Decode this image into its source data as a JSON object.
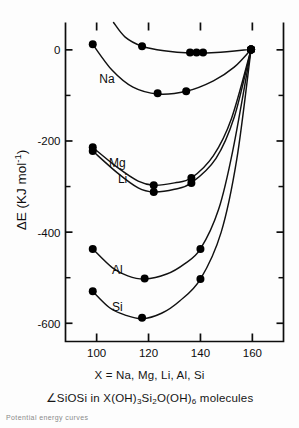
{
  "figure": {
    "xaxis_caption_prefix": "X = ",
    "xaxis_caption_values": "Na, Mg, Li, Al, Si",
    "caption_angle_symbol": "∠",
    "caption_text_a": "SiOSi in X(OH)",
    "caption_sub_3": "3",
    "caption_text_b": "Si",
    "caption_sub_2": "2",
    "caption_text_c": "O(OH)",
    "caption_sub_6": "6",
    "caption_text_d": " molecules",
    "fragment_text": "Potential energy curves",
    "axis_color": "#0d0d0d",
    "curve_color": "#111111",
    "marker_color": "#000000"
  },
  "chart_data": {
    "type": "line",
    "title": "",
    "subtitle": "∠SiOSi in X(OH)3Si2O(OH)6 molecules",
    "xlabel": "X = Na, Mg, Li, Al, Si",
    "ylabel": "ΔE ( KJ mol⁻¹ )",
    "ylabel_parts": {
      "delta": "ΔE (",
      "unit": "KJ mol",
      "exponent": "-1",
      "close": ")"
    },
    "xlim": [
      88,
      172
    ],
    "ylim": [
      -640,
      60
    ],
    "xticks": [
      100,
      120,
      140,
      160
    ],
    "xticklabels": [
      "100",
      "120",
      "140",
      "160"
    ],
    "xminorticks": [
      110,
      130,
      150,
      170
    ],
    "yticks": [
      0,
      -200,
      -400,
      -600
    ],
    "yticklabels": [
      "0",
      "-200",
      "-400",
      "-600"
    ],
    "yminorticks": [
      -100,
      -300,
      -500
    ],
    "grid": false,
    "legend": "inline-labels",
    "series": [
      {
        "name": "H2O (upper)",
        "label": "",
        "label_x": null,
        "label_y": null,
        "points": [
          {
            "x": 98.5,
            "y": 12
          },
          {
            "x": 117.5,
            "y": 8
          },
          {
            "x": 136.0,
            "y": -6
          },
          {
            "x": 138.5,
            "y": -6
          },
          {
            "x": 141.0,
            "y": -6
          },
          {
            "x": 159.5,
            "y": 1
          }
        ],
        "curve": [
          {
            "x": 106.5,
            "y": 60
          },
          {
            "x": 111.0,
            "y": 28
          },
          {
            "x": 117.5,
            "y": 8
          },
          {
            "x": 126.0,
            "y": -2
          },
          {
            "x": 136.0,
            "y": -7
          },
          {
            "x": 146.0,
            "y": -6
          },
          {
            "x": 159.5,
            "y": 1
          }
        ]
      },
      {
        "name": "Na",
        "label": "Na",
        "label_x": 104,
        "label_y": -73,
        "points": [
          {
            "x": 123.5,
            "y": -95
          },
          {
            "x": 134.5,
            "y": -91
          },
          {
            "x": 159.5,
            "y": 1
          }
        ],
        "curve": [
          {
            "x": 98.5,
            "y": 12
          },
          {
            "x": 106.0,
            "y": -45
          },
          {
            "x": 114.0,
            "y": -82
          },
          {
            "x": 123.5,
            "y": -97
          },
          {
            "x": 134.5,
            "y": -91
          },
          {
            "x": 145.0,
            "y": -68
          },
          {
            "x": 153.0,
            "y": -38
          },
          {
            "x": 159.5,
            "y": 1
          }
        ]
      },
      {
        "name": "Mg",
        "label": "Mg",
        "label_x": 108,
        "label_y": -258,
        "points": [
          {
            "x": 98.5,
            "y": -214
          },
          {
            "x": 122.0,
            "y": -297
          },
          {
            "x": 136.5,
            "y": -281
          },
          {
            "x": 159.5,
            "y": 1
          }
        ],
        "curve": [
          {
            "x": 98.5,
            "y": -214
          },
          {
            "x": 108.0,
            "y": -258
          },
          {
            "x": 116.0,
            "y": -288
          },
          {
            "x": 122.0,
            "y": -297
          },
          {
            "x": 130.0,
            "y": -292
          },
          {
            "x": 136.5,
            "y": -281
          },
          {
            "x": 145.0,
            "y": -232
          },
          {
            "x": 152.0,
            "y": -150
          },
          {
            "x": 159.5,
            "y": 1
          }
        ]
      },
      {
        "name": "Li",
        "label": "Li",
        "label_x": 110,
        "label_y": -292,
        "points": [
          {
            "x": 98.5,
            "y": -222
          },
          {
            "x": 122.0,
            "y": -312
          },
          {
            "x": 136.5,
            "y": -292
          },
          {
            "x": 159.5,
            "y": 1
          }
        ],
        "curve": [
          {
            "x": 98.5,
            "y": -222
          },
          {
            "x": 108.0,
            "y": -270
          },
          {
            "x": 116.0,
            "y": -303
          },
          {
            "x": 122.0,
            "y": -312
          },
          {
            "x": 130.0,
            "y": -306
          },
          {
            "x": 136.5,
            "y": -292
          },
          {
            "x": 146.0,
            "y": -238
          },
          {
            "x": 153.0,
            "y": -148
          },
          {
            "x": 159.5,
            "y": 1
          }
        ]
      },
      {
        "name": "Al",
        "label": "Al",
        "label_x": 108,
        "label_y": -492,
        "points": [
          {
            "x": 98.5,
            "y": -437
          },
          {
            "x": 118.5,
            "y": -502
          },
          {
            "x": 140.0,
            "y": -437
          },
          {
            "x": 159.5,
            "y": 1
          }
        ],
        "curve": [
          {
            "x": 98.5,
            "y": -437
          },
          {
            "x": 106.0,
            "y": -478
          },
          {
            "x": 112.0,
            "y": -496
          },
          {
            "x": 118.5,
            "y": -503
          },
          {
            "x": 127.0,
            "y": -492
          },
          {
            "x": 134.0,
            "y": -469
          },
          {
            "x": 140.0,
            "y": -437
          },
          {
            "x": 147.0,
            "y": -350
          },
          {
            "x": 152.5,
            "y": -220
          },
          {
            "x": 159.5,
            "y": 1
          }
        ]
      },
      {
        "name": "Si",
        "label": "Si",
        "label_x": 108,
        "label_y": -573,
        "points": [
          {
            "x": 98.5,
            "y": -530
          },
          {
            "x": 117.5,
            "y": -588
          },
          {
            "x": 140.0,
            "y": -503
          },
          {
            "x": 159.5,
            "y": 1
          }
        ],
        "curve": [
          {
            "x": 98.5,
            "y": -530
          },
          {
            "x": 105.0,
            "y": -566
          },
          {
            "x": 111.0,
            "y": -582
          },
          {
            "x": 117.5,
            "y": -590
          },
          {
            "x": 125.0,
            "y": -578
          },
          {
            "x": 132.0,
            "y": -551
          },
          {
            "x": 140.0,
            "y": -503
          },
          {
            "x": 148.0,
            "y": -400
          },
          {
            "x": 154.0,
            "y": -240
          },
          {
            "x": 159.5,
            "y": 1
          }
        ]
      }
    ]
  }
}
